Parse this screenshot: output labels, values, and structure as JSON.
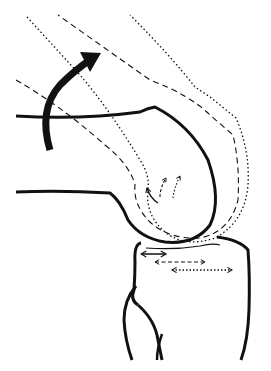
{
  "diagram": {
    "text_labels": [],
    "colors": {
      "background": "#ffffff",
      "line": "#111111"
    },
    "elements": {
      "femur_solid": "femur outline (current position)",
      "femur_dashed": "femur outline (intermediate position)",
      "femur_dotted": "femur outline (flexed position)",
      "rotation_arrow": "curved flexion arrow",
      "contact_arrows": [
        "solid double arrow",
        "dashed double arrow",
        "dotted double arrow"
      ],
      "rotation_small_arrows": [
        "solid small arrow",
        "dashed small arrow",
        "dotted small arrow"
      ],
      "tibia": "tibia outline",
      "fibula": "fibula outline"
    }
  }
}
